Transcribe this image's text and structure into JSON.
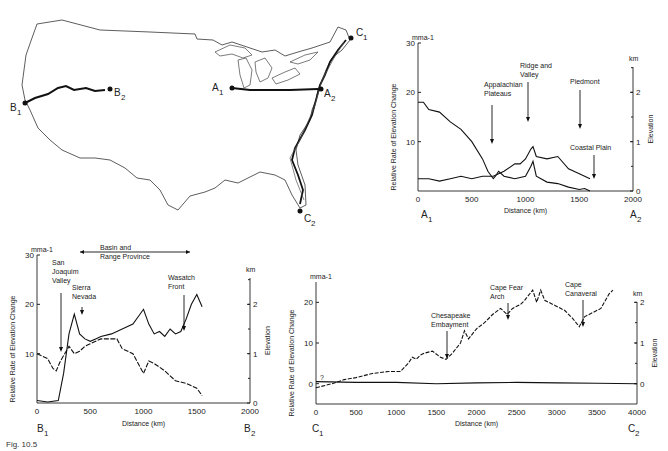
{
  "map": {
    "title": "Profile lines across the conterminous United States",
    "points": [
      {
        "id": "A1",
        "label": "A",
        "sub": "1"
      },
      {
        "id": "A2",
        "label": "A",
        "sub": "2"
      },
      {
        "id": "B1",
        "label": "B",
        "sub": "1"
      },
      {
        "id": "B2",
        "label": "B",
        "sub": "2"
      },
      {
        "id": "C1",
        "label": "C",
        "sub": "1"
      },
      {
        "id": "C2",
        "label": "C",
        "sub": "2"
      }
    ]
  },
  "chart_data": [
    {
      "id": "profile-A",
      "type": "line",
      "title": "",
      "xlabel": "Distance (km)",
      "ylabel": "Relative Rate of Elevation Change",
      "yunit": "mma-1",
      "y2label": "Elevation",
      "y2unit": "km",
      "xlim": [
        0,
        2000
      ],
      "ylim": [
        0,
        30
      ],
      "y2lim": [
        0,
        3
      ],
      "xticks": [
        0,
        500,
        1000,
        1500,
        2000
      ],
      "yticks": [
        10,
        20,
        30
      ],
      "y2ticks": [
        0,
        1,
        2
      ],
      "endpoints": {
        "left": "A1",
        "right": "A2"
      },
      "annotations": [
        {
          "text": "Appalachian Plateaus",
          "x": 580
        },
        {
          "text": "Ridge and Valley",
          "x": 880
        },
        {
          "text": "Piedmont",
          "x": 1450
        },
        {
          "text": "Coastal Plain",
          "x": 1600
        }
      ],
      "series": [
        {
          "name": "Relative rate of elevation change",
          "axis": "left",
          "x": [
            0,
            50,
            100,
            200,
            300,
            400,
            500,
            600,
            650,
            700,
            720,
            750,
            800,
            900,
            1000,
            1050,
            1070,
            1100,
            1200,
            1300,
            1400,
            1500,
            1550,
            1600
          ],
          "y": [
            18,
            18,
            16.5,
            16,
            14,
            12.5,
            10,
            6.5,
            4,
            2.5,
            3,
            4,
            3,
            2.5,
            3,
            5,
            6,
            3,
            1.8,
            1.5,
            0.8,
            0.3,
            0.5,
            0
          ]
        },
        {
          "name": "Elevation",
          "axis": "right",
          "x": [
            0,
            100,
            200,
            300,
            400,
            500,
            600,
            700,
            750,
            800,
            900,
            950,
            1000,
            1050,
            1070,
            1100,
            1200,
            1300,
            1400,
            1500,
            1600
          ],
          "y": [
            0.25,
            0.25,
            0.2,
            0.25,
            0.3,
            0.25,
            0.3,
            0.3,
            0.35,
            0.4,
            0.55,
            0.55,
            0.65,
            0.85,
            0.9,
            0.7,
            0.65,
            0.7,
            0.45,
            0.35,
            0.25
          ]
        }
      ]
    },
    {
      "id": "profile-B",
      "type": "line",
      "title": "",
      "xlabel": "Distance (km)",
      "ylabel": "Relative Rate of Elevation Change",
      "yunit": "mma-1",
      "y2label": "Elevation",
      "y2unit": "km",
      "xlim": [
        0,
        2000
      ],
      "ylim": [
        0,
        30
      ],
      "y2lim": [
        0,
        3
      ],
      "xticks": [
        0,
        500,
        1000,
        1500,
        2000
      ],
      "yticks": [
        10,
        20,
        30
      ],
      "y2ticks": [
        0,
        1,
        2
      ],
      "endpoints": {
        "left": "B1",
        "right": "B2"
      },
      "annotations": [
        {
          "text": "Basin and Range Province",
          "x_from": 380,
          "x_to": 1400,
          "type": "span"
        },
        {
          "text": "San Joaquim Valley",
          "x": 180
        },
        {
          "text": "Sierra Nevada",
          "x": 350
        },
        {
          "text": "Wasatch Front",
          "x": 1330
        }
      ],
      "series": [
        {
          "name": "Relative rate of elevation change",
          "axis": "left",
          "x": [
            0,
            100,
            150,
            180,
            220,
            300,
            350,
            400,
            450,
            500,
            550,
            600,
            650,
            700,
            750,
            800,
            900,
            1000,
            1050,
            1100,
            1200,
            1300,
            1400,
            1500,
            1550
          ],
          "y": [
            10,
            9,
            7,
            6.5,
            8.5,
            11.5,
            10,
            10.5,
            11.5,
            12,
            12.5,
            13,
            13,
            13,
            13,
            11,
            10,
            6,
            8.5,
            8,
            6.5,
            4.5,
            4,
            3,
            1.5
          ]
        },
        {
          "name": "Elevation",
          "axis": "right",
          "x": [
            0,
            100,
            200,
            250,
            300,
            350,
            400,
            450,
            500,
            550,
            600,
            700,
            800,
            900,
            950,
            1000,
            1050,
            1100,
            1150,
            1200,
            1250,
            1300,
            1350,
            1400,
            1450,
            1500,
            1550
          ],
          "y": [
            0.05,
            0.02,
            0.05,
            0.6,
            1.4,
            1.8,
            1.4,
            1.3,
            1.25,
            1.3,
            1.35,
            1.4,
            1.5,
            1.6,
            1.75,
            1.9,
            1.6,
            1.4,
            1.45,
            1.35,
            1.5,
            1.4,
            1.45,
            1.7,
            2.0,
            2.2,
            1.95
          ]
        }
      ]
    },
    {
      "id": "profile-C",
      "type": "line",
      "title": "",
      "xlabel": "Distance (km)",
      "ylabel": "Relative Rate of Elevation Change",
      "yunit": "mma-1",
      "y2label": "Elevation",
      "y2unit": "km",
      "xlim": [
        0,
        4000
      ],
      "ylim": [
        -5,
        25
      ],
      "y2lim": [
        -0.5,
        2.5
      ],
      "xticks": [
        0,
        500,
        1000,
        1500,
        2000,
        2500,
        3000,
        3500,
        4000
      ],
      "yticks": [
        0,
        10,
        20
      ],
      "y2ticks": [
        0,
        1,
        2
      ],
      "endpoints": {
        "left": "C1",
        "right": "C2"
      },
      "annotations": [
        {
          "text": "?",
          "x": 80
        },
        {
          "text": "Chesapeake Embayment",
          "x": 1620
        },
        {
          "text": "Cape Fear Arch",
          "x": 2380
        },
        {
          "text": "Cape Canaveral",
          "x": 3300
        }
      ],
      "series": [
        {
          "name": "Relative rate of elevation change",
          "axis": "left",
          "x": [
            0,
            200,
            350,
            500,
            700,
            900,
            1050,
            1150,
            1200,
            1250,
            1300,
            1350,
            1450,
            1550,
            1620,
            1700,
            1800,
            1850,
            1900,
            2000,
            2100,
            2200,
            2300,
            2380,
            2450,
            2550,
            2600,
            2700,
            2750,
            2800,
            2850,
            3000,
            3100,
            3200,
            3280,
            3350,
            3450,
            3550,
            3650,
            3700
          ],
          "y": [
            -1,
            0,
            1,
            1.5,
            2.5,
            3,
            3,
            5,
            6.5,
            6,
            7,
            7.5,
            8,
            6.5,
            6,
            7.5,
            10,
            13,
            11,
            13.5,
            15,
            17,
            18.5,
            17,
            18.5,
            19.5,
            20.5,
            23,
            20,
            23,
            20.5,
            19,
            18,
            16,
            14,
            16.5,
            17.5,
            18.5,
            22,
            23
          ]
        },
        {
          "name": "Elevation",
          "axis": "right",
          "x": [
            0,
            500,
            1000,
            1500,
            2000,
            2500,
            3000,
            3500,
            4000
          ],
          "y": [
            0.05,
            0.03,
            0.03,
            0.0,
            0.02,
            0.03,
            0.02,
            0.01,
            0.0
          ]
        }
      ]
    }
  ],
  "caption": "Fig. 10.5"
}
